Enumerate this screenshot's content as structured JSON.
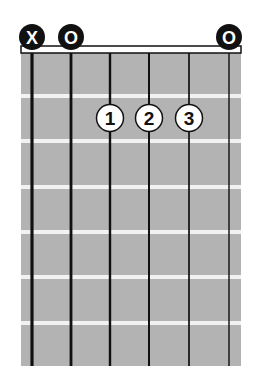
{
  "diagram": {
    "type": "guitar-chord-chart",
    "colors": {
      "fretboard": "#b3b3b3",
      "fret_line": "#f2f2f2",
      "string": "#111111",
      "marker_fill": "#111111",
      "marker_text": "#ffffff",
      "finger_fill": "#ffffff",
      "finger_text": "#111111"
    },
    "strings": 6,
    "frets_shown": 6,
    "string_markers": [
      {
        "string": 6,
        "label": "X",
        "meaning": "muted"
      },
      {
        "string": 5,
        "label": "O",
        "meaning": "open"
      },
      {
        "string": 4,
        "label": "",
        "meaning": "fretted"
      },
      {
        "string": 3,
        "label": "",
        "meaning": "fretted"
      },
      {
        "string": 2,
        "label": "",
        "meaning": "fretted"
      },
      {
        "string": 1,
        "label": "O",
        "meaning": "open"
      }
    ],
    "fingers": [
      {
        "string": 4,
        "fret": 2,
        "label": "1"
      },
      {
        "string": 3,
        "fret": 2,
        "label": "2"
      },
      {
        "string": 2,
        "fret": 2,
        "label": "3"
      }
    ]
  }
}
